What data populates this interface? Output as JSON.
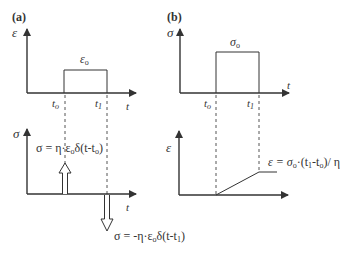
{
  "figure": {
    "line_color": "#333333",
    "dash_color": "#555555",
    "background": "#ffffff"
  },
  "panel_a": {
    "label": "(a)",
    "top": {
      "y_axis_label": "ε",
      "x_axis_label": "t",
      "pulse_label_main": "ε",
      "pulse_label_sub": "o",
      "tick_t0_main": "t",
      "tick_t0_sub": "o",
      "tick_t1_main": "t",
      "tick_t1_sub": "1"
    },
    "bottom": {
      "y_axis_label": "σ",
      "x_axis_label": "t",
      "impulse_up_eq": "σ = η·ε",
      "impulse_up_eq_sub": "o",
      "impulse_up_eq_tail": "δ(t-t",
      "impulse_up_eq_tail_sub": "o",
      "impulse_up_eq_end": ")",
      "impulse_down_eq": "σ = -η·ε",
      "impulse_down_eq_sub": "o",
      "impulse_down_eq_tail": "δ(t-t",
      "impulse_down_eq_tail_sub": "1",
      "impulse_down_eq_end": ")"
    }
  },
  "panel_b": {
    "label": "(b)",
    "top": {
      "y_axis_label": "σ",
      "x_axis_label": "t",
      "pulse_label_main": "σ",
      "pulse_label_sub": "o",
      "tick_t0_main": "t",
      "tick_t0_sub": "o",
      "tick_t1_main": "t",
      "tick_t1_sub": "1"
    },
    "bottom": {
      "y_axis_label": "ε",
      "ramp_eq_head": "ε = σ",
      "ramp_eq_head_sub": "o",
      "ramp_eq_mid": "·(t",
      "ramp_eq_mid_sub1": "1",
      "ramp_eq_mid2": "-t",
      "ramp_eq_mid_sub2": "o",
      "ramp_eq_end": ")/ η"
    }
  }
}
